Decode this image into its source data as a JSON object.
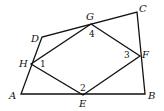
{
  "diagram": {
    "type": "geometry",
    "vertices": {
      "A": "A",
      "B": "B",
      "C": "C",
      "D": "D",
      "E": "E",
      "F": "F",
      "G": "G",
      "H": "H"
    },
    "angles": {
      "a1": "1",
      "a2": "2",
      "a3": "3",
      "a4": "4"
    },
    "outer_quadrilateral": [
      "A",
      "B",
      "C",
      "D"
    ],
    "inner_quadrilateral": [
      "E",
      "F",
      "G",
      "H"
    ],
    "line_color": "#111111"
  }
}
